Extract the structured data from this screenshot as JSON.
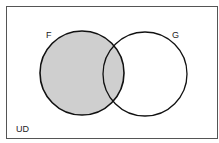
{
  "diagram": {
    "type": "venn",
    "universe_label": "UD",
    "sets": [
      {
        "name": "F",
        "label": "F",
        "shaded": true
      },
      {
        "name": "G",
        "label": "G",
        "shaded": false
      }
    ],
    "shaded_region": "F",
    "colors": {
      "shade": "#cfcfcf",
      "stroke": "#111111",
      "border": "#555555",
      "background": "#ffffff"
    }
  }
}
